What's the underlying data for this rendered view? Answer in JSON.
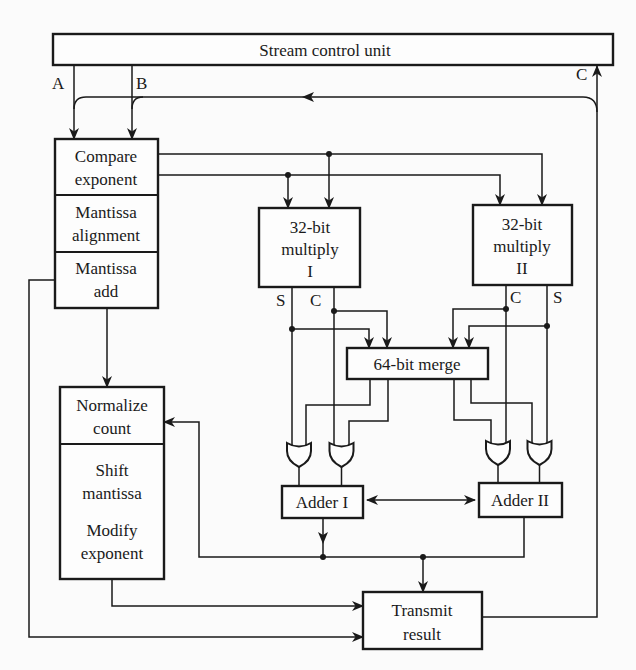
{
  "diagram": {
    "stream_control": {
      "label": "Stream control unit"
    },
    "signals": {
      "a": "A",
      "b": "B",
      "c": "C"
    },
    "compare_unit": {
      "stages": [
        {
          "line1": "Compare",
          "line2": "exponent"
        },
        {
          "line1": "Mantissa",
          "line2": "alignment"
        },
        {
          "line1": "Mantissa",
          "line2": "add"
        }
      ]
    },
    "multiplier_1": {
      "line1": "32-bit",
      "line2": "multiply",
      "line3": "I",
      "sum_label": "S",
      "carry_label": "C"
    },
    "multiplier_2": {
      "line1": "32-bit",
      "line2": "multiply",
      "line3": "II",
      "sum_label": "S",
      "carry_label": "C"
    },
    "merge": {
      "label": "64-bit merge"
    },
    "adder_1": {
      "label": "Adder I"
    },
    "adder_2": {
      "label": "Adder II"
    },
    "normalize_unit": {
      "stages": [
        {
          "line1": "Normalize",
          "line2": "count"
        },
        {
          "line1": "Shift",
          "line2": "mantissa",
          "line3": "Modify",
          "line4": "exponent"
        }
      ]
    },
    "transmit": {
      "line1": "Transmit",
      "line2": "result"
    },
    "connections": [
      "Stream control unit -> Compare exponent (A)",
      "Stream control unit -> Compare exponent (B)",
      "Transmit result -> Stream control unit (C)",
      "C -> A/B feedback",
      "Compare exponent -> 32-bit multiply I",
      "Compare exponent -> 32-bit multiply II",
      "Multiply I S/C -> 64-bit merge",
      "Multiply II C/S -> 64-bit merge",
      "64-bit merge -> OR gates -> Adder I",
      "64-bit merge -> OR gates -> Adder II",
      "Adder I <-> Adder II",
      "Adder I/II -> Normalize count",
      "Adder I/II -> Transmit result",
      "Mantissa add -> Normalize count",
      "Mantissa add -> Transmit result",
      "Modify exponent -> Transmit result"
    ],
    "colors": {
      "line": "#1a1a1a",
      "background": "#fbfbfb"
    }
  }
}
